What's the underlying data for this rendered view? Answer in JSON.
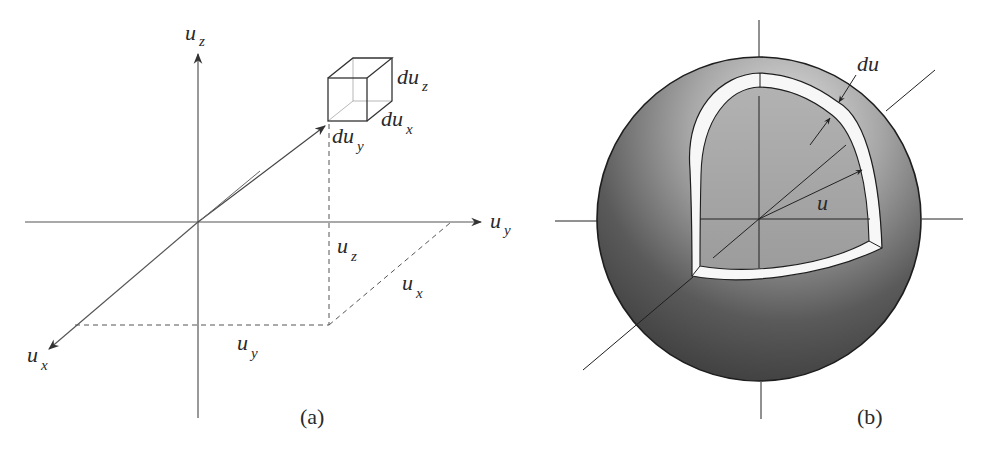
{
  "figure": {
    "panels": [
      {
        "id": "a",
        "caption": "(a)",
        "description": "Cartesian velocity space with volume element du_x du_y du_z",
        "axes": {
          "z": {
            "label_main": "u",
            "label_sub": "z"
          },
          "y": {
            "label_main": "u",
            "label_sub": "y"
          },
          "x": {
            "label_main": "u",
            "label_sub": "x"
          }
        },
        "cube_labels": {
          "dz": {
            "main": "du",
            "sub": "z"
          },
          "dx": {
            "main": "du",
            "sub": "x"
          },
          "dy": {
            "main": "du",
            "sub": "y"
          }
        },
        "projection_labels": {
          "uz": {
            "main": "u",
            "sub": "z"
          },
          "ux": {
            "main": "u",
            "sub": "x"
          },
          "uy": {
            "main": "u",
            "sub": "y"
          }
        }
      },
      {
        "id": "b",
        "caption": "(b)",
        "description": "Spherical shell of radius u and thickness du in velocity space",
        "labels": {
          "shell_thickness": "du",
          "radius": "u"
        },
        "colors": {
          "sphere_light": "#d9d9d9",
          "sphere_dark": "#3e3e3e",
          "cutout_fill": "#a8a8a8",
          "shell_band": "#f7f7f7",
          "line": "#222222"
        }
      }
    ]
  }
}
